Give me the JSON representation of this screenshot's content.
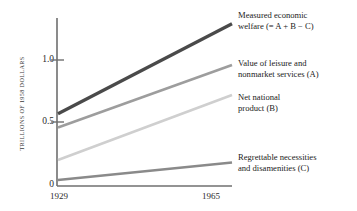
{
  "chart_data": {
    "type": "line",
    "title": "",
    "xlabel": "",
    "ylabel": "TRILLIONS OF 1958 DOLLARS",
    "x": [
      1929,
      1965
    ],
    "xtick_labels": [
      "1929",
      "1965"
    ],
    "ytick_labels": [
      "0",
      "0.5",
      "1.0"
    ],
    "ytick_values": [
      0,
      0.5,
      1.0
    ],
    "ylim": [
      0,
      1.35
    ],
    "xlim": [
      1929,
      1965
    ],
    "grid": false,
    "legend_position": "right-of-axes",
    "series": [
      {
        "name": "Measured economic welfare (= A + B − C)",
        "label_line1": "Measured economic",
        "label_line2": "welfare (= A + B − C)",
        "values": [
          0.57,
          1.29
        ],
        "color": "#4a4a4a",
        "width": 3.2
      },
      {
        "name": "Value of leisure and nonmarket services (A)",
        "label_line1": "Value of leisure and",
        "label_line2": "nonmarket services (A)",
        "values": [
          0.46,
          0.96
        ],
        "color": "#9d9d9d",
        "width": 2.6
      },
      {
        "name": "Net national product (B)",
        "label_line1": "Net national",
        "label_line2": "product (B)",
        "values": [
          0.2,
          0.72
        ],
        "color": "#cfcfcf",
        "width": 2.6
      },
      {
        "name": "Regrettable necessities and disamenities (C)",
        "label_line1": "Regrettable necessities",
        "label_line2": "and disamenities (C)",
        "values": [
          0.04,
          0.18
        ],
        "color": "#8a8a8a",
        "width": 2.6
      }
    ]
  },
  "axes": {
    "axis_color": "#6f6f6f"
  }
}
